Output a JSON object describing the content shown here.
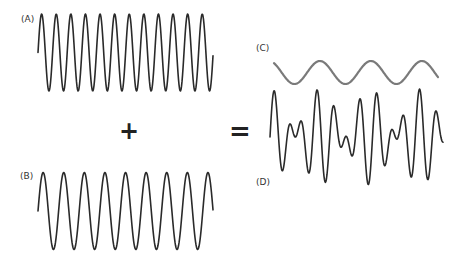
{
  "labels": {
    "a": "(A)",
    "b": "(B)",
    "c": "(C)",
    "d": "(D)"
  },
  "operators": {
    "plus": "+",
    "equals": "="
  },
  "colors": {
    "wave_dark": "#2a2a2a",
    "wave_gray": "#7a7a7a",
    "background": "#ffffff"
  },
  "waves": {
    "a": {
      "x0": 38,
      "x1": 213,
      "center": 52.5,
      "amplitude": 38.5,
      "period": 14.6,
      "phase": 0,
      "color_key": "wave_dark",
      "stroke": 1.6
    },
    "b": {
      "x0": 38,
      "x1": 213,
      "center": 211,
      "amplitude": 38.5,
      "period": 20.6,
      "phase": 0,
      "color_key": "wave_dark",
      "stroke": 1.6
    },
    "c": {
      "x0": 274,
      "x1": 438,
      "center": 72.5,
      "amplitude": 11.5,
      "period": 51,
      "phase": 2.2,
      "color_key": "wave_gray",
      "stroke": 2.2
    },
    "d": {
      "x0": 270,
      "x1": 443,
      "center": 137,
      "components": [
        {
          "amplitude": 24,
          "period": 14.6,
          "phase": 0
        },
        {
          "amplitude": 24,
          "period": 20.6,
          "phase": 0
        }
      ],
      "color_key": "wave_dark",
      "stroke": 1.6
    }
  }
}
